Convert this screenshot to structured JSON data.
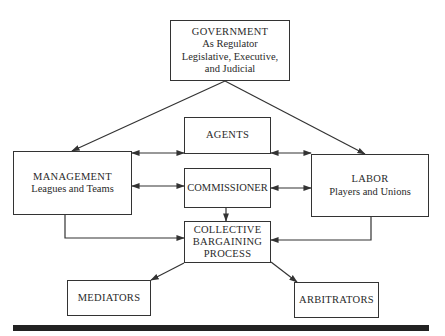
{
  "diagram": {
    "nodes": {
      "government": {
        "title": "GOVERNMENT",
        "lines": [
          "As Regulator",
          "Legislative, Executive,",
          "and Judicial"
        ]
      },
      "agents": {
        "title": "AGENTS"
      },
      "management": {
        "title": "MANAGEMENT",
        "lines": [
          "Leagues and Teams"
        ]
      },
      "commissioner": {
        "title": "COMMISSIONER"
      },
      "labor": {
        "title": "LABOR",
        "lines": [
          "Players and Unions"
        ]
      },
      "collective_bargaining": {
        "title_lines": [
          "COLLECTIVE",
          "BARGAINING",
          "PROCESS"
        ]
      },
      "mediators": {
        "title": "MEDIATORS"
      },
      "arbitrators": {
        "title": "ARBITRATORS"
      }
    },
    "edges": [
      {
        "from": "government",
        "to": "management",
        "type": "arrow"
      },
      {
        "from": "government",
        "to": "labor",
        "type": "arrow"
      },
      {
        "from": "management",
        "to": "agents",
        "type": "bidirectional"
      },
      {
        "from": "agents",
        "to": "labor",
        "type": "bidirectional"
      },
      {
        "from": "management",
        "to": "commissioner",
        "type": "bidirectional"
      },
      {
        "from": "commissioner",
        "to": "labor",
        "type": "bidirectional"
      },
      {
        "from": "commissioner",
        "to": "collective_bargaining",
        "type": "arrow"
      },
      {
        "from": "management",
        "to": "collective_bargaining",
        "type": "arrow"
      },
      {
        "from": "labor",
        "to": "collective_bargaining",
        "type": "arrow"
      },
      {
        "from": "collective_bargaining",
        "to": "mediators",
        "type": "arrow"
      },
      {
        "from": "collective_bargaining",
        "to": "arbitrators",
        "type": "arrow"
      }
    ],
    "colors": {
      "stroke": "#333333",
      "text": "#2a2a2a",
      "background": "#ffffff",
      "rule": "#222222"
    }
  }
}
